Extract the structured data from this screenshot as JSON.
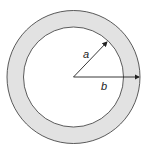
{
  "diagram": {
    "colors": {
      "ring_fill": "#e2e2e2",
      "stroke": "#333333",
      "background": "#ffffff"
    },
    "labels": {
      "inner_radius": "a",
      "outer_radius": "b"
    }
  }
}
